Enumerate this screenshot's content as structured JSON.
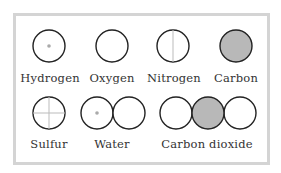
{
  "colors": {
    "frame": "#d4d4d4",
    "outline": "#222222",
    "carbon_fill": "#b8b8b8",
    "hydrogen_dot": "#aaaaaa",
    "inner_line": "#bbbbbb"
  },
  "atoms": [
    {
      "name": "Hydrogen",
      "symbol": "circle-with-dot"
    },
    {
      "name": "Oxygen",
      "symbol": "empty-circle"
    },
    {
      "name": "Nitrogen",
      "symbol": "circle-with-vertical-line"
    },
    {
      "name": "Carbon",
      "symbol": "filled-gray-circle"
    },
    {
      "name": "Sulfur",
      "symbol": "circle-with-cross"
    }
  ],
  "molecules": [
    {
      "name": "Water",
      "composition": [
        "Hydrogen",
        "Oxygen"
      ]
    },
    {
      "name": "Carbon dioxide",
      "composition": [
        "Oxygen",
        "Carbon",
        "Oxygen"
      ]
    }
  ],
  "labels": {
    "hydrogen": "Hydrogen",
    "oxygen": "Oxygen",
    "nitrogen": "Nitrogen",
    "carbon": "Carbon",
    "sulfur": "Sulfur",
    "water": "Water",
    "carbon_dioxide": "Carbon dioxide"
  }
}
